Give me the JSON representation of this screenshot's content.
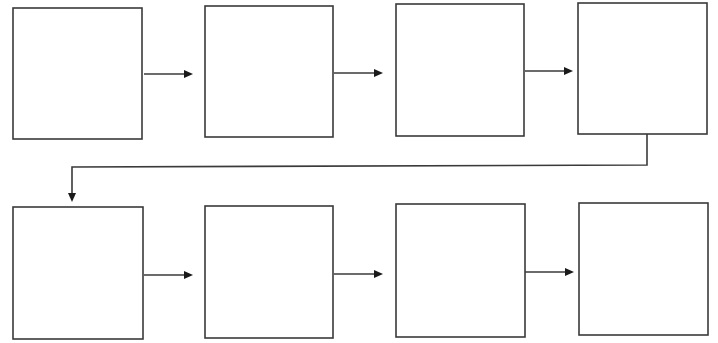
{
  "diagram": {
    "type": "flowchart",
    "colors": {
      "stroke": "#3a3a3a",
      "arrowhead": "#1a1a1a",
      "fill": "#ffffff",
      "background": "#ffffff"
    },
    "nodes": [
      {
        "id": "box-1",
        "label": "",
        "x": 13,
        "y": 8,
        "w": 129,
        "h": 131
      },
      {
        "id": "box-2",
        "label": "",
        "x": 205,
        "y": 6,
        "w": 128,
        "h": 131
      },
      {
        "id": "box-3",
        "label": "",
        "x": 396,
        "y": 4,
        "w": 128,
        "h": 132
      },
      {
        "id": "box-4",
        "label": "",
        "x": 578,
        "y": 3,
        "w": 129,
        "h": 131
      },
      {
        "id": "box-5",
        "label": "",
        "x": 13,
        "y": 207,
        "w": 130,
        "h": 132
      },
      {
        "id": "box-6",
        "label": "",
        "x": 205,
        "y": 206,
        "w": 128,
        "h": 132
      },
      {
        "id": "box-7",
        "label": "",
        "x": 396,
        "y": 204,
        "w": 129,
        "h": 133
      },
      {
        "id": "box-8",
        "label": "",
        "x": 579,
        "y": 203,
        "w": 129,
        "h": 132
      }
    ],
    "edges": [
      {
        "from": "box-1",
        "to": "box-2",
        "points": [
          [
            144,
            74
          ],
          [
            193,
            74
          ]
        ]
      },
      {
        "from": "box-2",
        "to": "box-3",
        "points": [
          [
            334,
            73
          ],
          [
            383,
            73
          ]
        ]
      },
      {
        "from": "box-3",
        "to": "box-4",
        "points": [
          [
            525,
            71
          ],
          [
            573,
            71
          ]
        ]
      },
      {
        "from": "box-4",
        "to": "box-5",
        "points": [
          [
            647,
            134
          ],
          [
            647,
            165
          ],
          [
            72,
            167
          ],
          [
            72,
            202
          ]
        ]
      },
      {
        "from": "box-5",
        "to": "box-6",
        "points": [
          [
            144,
            275
          ],
          [
            193,
            275
          ]
        ]
      },
      {
        "from": "box-6",
        "to": "box-7",
        "points": [
          [
            334,
            274
          ],
          [
            383,
            274
          ]
        ]
      },
      {
        "from": "box-7",
        "to": "box-8",
        "points": [
          [
            525,
            272
          ],
          [
            574,
            272
          ]
        ]
      }
    ]
  }
}
